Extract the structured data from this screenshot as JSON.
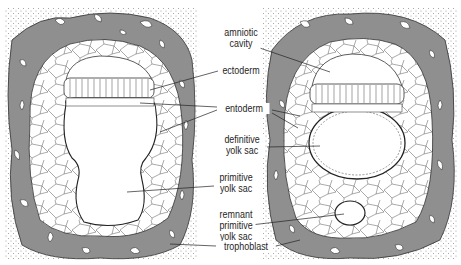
{
  "figure": {
    "panels": [
      {
        "name": "left-embryo",
        "stage": "primitive yolk sac stage"
      },
      {
        "name": "right-embryo",
        "stage": "definitive yolk sac stage"
      }
    ],
    "labels": {
      "amniotic_cavity": "amniotic\ncavity",
      "ectoderm": "ectoderm",
      "entoderm": "entoderm",
      "definitive_yolk_sac": "definitive\nyolk sac",
      "primitive_yolk_sac": "primitive\nyolk sac",
      "remnant_primitive_yolk_sac": "remnant\nprimitive\nyolk sac",
      "trophoblast": "trophoblast"
    },
    "colors": {
      "background": "#ffffff",
      "trophoblast_gray": "#8f8f8f",
      "stipple": "#9a9a9a",
      "line": "#2a2a2a",
      "cell_fill": "#ffffff"
    }
  }
}
